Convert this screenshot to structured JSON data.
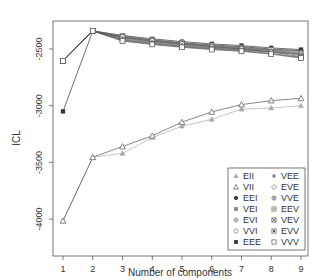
{
  "chart_data": {
    "type": "line",
    "title": "",
    "xlabel": "Number of components",
    "ylabel": "ICL",
    "x": [
      1,
      2,
      3,
      4,
      5,
      6,
      7,
      8,
      9
    ],
    "xlim": [
      0.7,
      9.3
    ],
    "ylim": [
      -4100,
      -2330
    ],
    "yticks": [
      -4000,
      -3500,
      -3000,
      -2500
    ],
    "ytick_labels": [
      "-4000",
      "-3500",
      "-3000",
      "-2500"
    ],
    "xtick_labels": [
      "1",
      "2",
      "3",
      "4",
      "5",
      "6",
      "7",
      "8",
      "9"
    ],
    "grid": false,
    "legend_position": "bottom-right",
    "series": [
      {
        "name": "EII",
        "marker": "filled-triangle-gray",
        "color": "#aaaaaa",
        "values": [
          -4015,
          -3455,
          -3420,
          -3280,
          -3180,
          -3120,
          -3030,
          -3020,
          -3000
        ]
      },
      {
        "name": "VII",
        "marker": "open-triangle",
        "color": "#555555",
        "values": [
          -4015,
          -3455,
          -3360,
          -3265,
          -3145,
          -3055,
          -2990,
          -2955,
          -2935
        ]
      },
      {
        "name": "EEI",
        "marker": "filled-circle",
        "color": "#333333",
        "values": [
          -2605,
          -2340,
          -2395,
          -2420,
          -2445,
          -2465,
          -2480,
          -2500,
          -2515
        ]
      },
      {
        "name": "VEI",
        "marker": "filled-square-gray",
        "color": "#888888",
        "values": [
          -2605,
          -2340,
          -2400,
          -2430,
          -2455,
          -2475,
          -2490,
          -2510,
          -2530
        ]
      },
      {
        "name": "EVI",
        "marker": "circle-plus-gray",
        "color": "#888888",
        "values": [
          -2605,
          -2340,
          -2410,
          -2440,
          -2465,
          -2485,
          -2500,
          -2520,
          -2540
        ]
      },
      {
        "name": "VVI",
        "marker": "open-circle",
        "color": "#777777",
        "values": [
          -2605,
          -2340,
          -2420,
          -2450,
          -2475,
          -2495,
          -2510,
          -2530,
          -2550
        ]
      },
      {
        "name": "EEE",
        "marker": "filled-square",
        "color": "#333333",
        "values": [
          -3050,
          -2340,
          -2380,
          -2410,
          -2435,
          -2455,
          -2470,
          -2490,
          -2505
        ]
      },
      {
        "name": "VEE",
        "marker": "asterisk",
        "color": "#666666",
        "values": [
          -2605,
          -2340,
          -2390,
          -2425,
          -2450,
          -2470,
          -2485,
          -2505,
          -2520
        ]
      },
      {
        "name": "EVE",
        "marker": "open-diamond",
        "color": "#666666",
        "values": [
          -2605,
          -2340,
          -2405,
          -2435,
          -2460,
          -2480,
          -2495,
          -2515,
          -2535
        ]
      },
      {
        "name": "VVE",
        "marker": "circle-plus",
        "color": "#666666",
        "values": [
          -2605,
          -2340,
          -2415,
          -2445,
          -2470,
          -2490,
          -2505,
          -2525,
          -2545
        ]
      },
      {
        "name": "EEV",
        "marker": "square-plus",
        "color": "#777777",
        "values": [
          -2605,
          -2340,
          -2385,
          -2420,
          -2445,
          -2470,
          -2490,
          -2510,
          -2560
        ]
      },
      {
        "name": "VEV",
        "marker": "square-x",
        "color": "#555555",
        "values": [
          -2605,
          -2340,
          -2395,
          -2430,
          -2455,
          -2480,
          -2500,
          -2525,
          -2570
        ]
      },
      {
        "name": "EVV",
        "marker": "square-filled-inner",
        "color": "#555555",
        "values": [
          -2605,
          -2340,
          -2425,
          -2455,
          -2480,
          -2500,
          -2515,
          -2540,
          -2575
        ]
      },
      {
        "name": "VVV",
        "marker": "open-square",
        "color": "#555555",
        "values": [
          -2605,
          -2340,
          -2430,
          -2460,
          -2485,
          -2505,
          -2520,
          -2545,
          -2580
        ]
      }
    ]
  },
  "legend": {
    "col1": [
      "EII",
      "VII",
      "EEI",
      "VEI",
      "EVI",
      "VVI",
      "EEE"
    ],
    "col2": [
      "VEE",
      "EVE",
      "VVE",
      "EEV",
      "VEV",
      "EVV",
      "VVV"
    ]
  }
}
